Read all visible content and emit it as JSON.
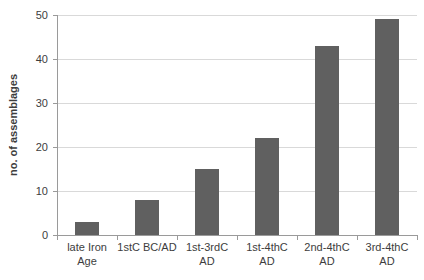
{
  "chart_data": {
    "type": "bar",
    "title": "",
    "xlabel": "",
    "ylabel": "no. of assemblages",
    "categories": [
      "late Iron Age",
      "1stC BC/AD",
      "1st-3rdC AD",
      "1st-4thC AD",
      "2nd-4thC AD",
      "3rd-4thC AD"
    ],
    "category_label_lines": [
      [
        "late Iron",
        "Age"
      ],
      [
        "1stC BC/AD"
      ],
      [
        "1st-3rdC",
        "AD"
      ],
      [
        "1st-4thC",
        "AD"
      ],
      [
        "2nd-4thC",
        "AD"
      ],
      [
        "3rd-4thC",
        "AD"
      ]
    ],
    "values": [
      3,
      8,
      15,
      22,
      43,
      49
    ],
    "ylim": [
      0,
      50
    ],
    "yticks": [
      0,
      10,
      20,
      30,
      40,
      50
    ],
    "grid": "horizontal",
    "legend_position": "none",
    "colors": {
      "bar": "#606060",
      "gridline": "#d9d9d9",
      "axis": "#9a9a9a",
      "text": "#3d3d3d"
    }
  }
}
